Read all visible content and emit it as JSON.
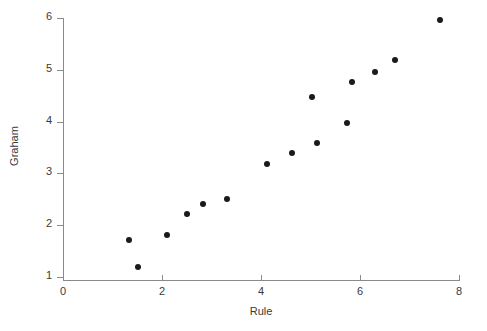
{
  "chart_data": {
    "type": "scatter",
    "title": "",
    "xlabel": "Rule",
    "ylabel": "Graham",
    "xlim": [
      0,
      8
    ],
    "ylim": [
      1,
      6
    ],
    "xticks": [
      0,
      2,
      4,
      6,
      8
    ],
    "yticks": [
      1,
      2,
      3,
      4,
      5,
      6
    ],
    "xtick_labels": [
      "0",
      "2",
      "4",
      "6",
      "8"
    ],
    "ytick_labels": [
      "1",
      "2",
      "3",
      "4",
      "5",
      "6"
    ],
    "grid": false,
    "legend": null,
    "marker": {
      "shape": "circle",
      "color": "#1a1a1a",
      "size_px": 6
    },
    "axis_color": "#8a8a8a",
    "background_color": "#ffffff",
    "points": [
      {
        "x": 1.33,
        "y": 1.71
      },
      {
        "x": 1.52,
        "y": 1.19
      },
      {
        "x": 2.11,
        "y": 1.81
      },
      {
        "x": 2.51,
        "y": 2.22
      },
      {
        "x": 2.82,
        "y": 2.4
      },
      {
        "x": 3.31,
        "y": 2.5
      },
      {
        "x": 4.12,
        "y": 3.18
      },
      {
        "x": 4.63,
        "y": 3.39
      },
      {
        "x": 5.04,
        "y": 4.47
      },
      {
        "x": 5.14,
        "y": 3.58
      },
      {
        "x": 5.73,
        "y": 3.98
      },
      {
        "x": 5.83,
        "y": 4.77
      },
      {
        "x": 6.31,
        "y": 4.96
      },
      {
        "x": 6.71,
        "y": 5.18
      },
      {
        "x": 7.61,
        "y": 5.96
      }
    ]
  }
}
